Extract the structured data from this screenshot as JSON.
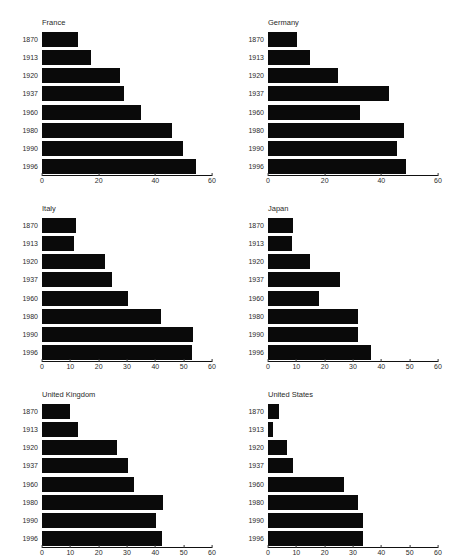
{
  "figure": {
    "caption_top": "",
    "bar_color": "#0a0a0a",
    "axis_color": "#111111",
    "text_color": "#2b2b2b"
  },
  "chart_data": [
    {
      "type": "bar",
      "title": "France",
      "orientation": "horizontal",
      "categories": [
        "1870",
        "1913",
        "1920",
        "1937",
        "1960",
        "1980",
        "1990",
        "1996"
      ],
      "values": [
        12.5,
        16.8,
        27.0,
        28.5,
        34.5,
        45.5,
        49.5,
        54.0
      ],
      "xlabel": "",
      "ylabel": "",
      "xlim": [
        0,
        60
      ],
      "xticks": [
        0,
        20,
        40,
        60
      ],
      "xticklabels": [
        "0",
        "20",
        "40",
        "60"
      ],
      "grid": false,
      "legend": null
    },
    {
      "type": "bar",
      "title": "Germany",
      "orientation": "horizontal",
      "categories": [
        "1870",
        "1913",
        "1920",
        "1937",
        "1960",
        "1980",
        "1990",
        "1996"
      ],
      "values": [
        10.0,
        14.5,
        24.5,
        42.5,
        32.0,
        47.5,
        45.0,
        48.5
      ],
      "xlabel": "",
      "ylabel": "",
      "xlim": [
        0,
        60
      ],
      "xticks": [
        0,
        20,
        40,
        60
      ],
      "xticklabels": [
        "0",
        "20",
        "40",
        "60"
      ],
      "grid": false,
      "legend": null
    },
    {
      "type": "bar",
      "title": "Italy",
      "orientation": "horizontal",
      "categories": [
        "1870",
        "1913",
        "1920",
        "1937",
        "1960",
        "1980",
        "1990",
        "1996"
      ],
      "values": [
        11.5,
        11.0,
        22.0,
        24.5,
        30.0,
        41.5,
        53.0,
        52.5
      ],
      "xlabel": "",
      "ylabel": "",
      "xlim": [
        0,
        60
      ],
      "xticks": [
        0,
        10,
        20,
        30,
        40,
        50,
        60
      ],
      "xticklabels": [
        "0",
        "10",
        "20",
        "30",
        "40",
        "50",
        "60"
      ],
      "grid": false,
      "legend": null
    },
    {
      "type": "bar",
      "title": "Japan",
      "orientation": "horizontal",
      "categories": [
        "1870",
        "1913",
        "1920",
        "1937",
        "1960",
        "1980",
        "1990",
        "1996"
      ],
      "values": [
        8.5,
        8.0,
        14.5,
        25.0,
        17.5,
        31.5,
        31.5,
        36.0
      ],
      "xlabel": "",
      "ylabel": "",
      "xlim": [
        0,
        60
      ],
      "xticks": [
        0,
        10,
        20,
        30,
        40,
        50,
        60
      ],
      "xticklabels": [
        "0",
        "10",
        "20",
        "30",
        "40",
        "50",
        "60"
      ],
      "grid": false,
      "legend": null
    },
    {
      "type": "bar",
      "title": "United Kingdom",
      "orientation": "horizontal",
      "categories": [
        "1870",
        "1913",
        "1920",
        "1937",
        "1960",
        "1980",
        "1990",
        "1996"
      ],
      "values": [
        9.5,
        12.5,
        26.0,
        30.0,
        32.0,
        42.5,
        40.0,
        42.0
      ],
      "xlabel": "",
      "ylabel": "",
      "xlim": [
        0,
        60
      ],
      "xticks": [
        0,
        10,
        20,
        30,
        40,
        50,
        60
      ],
      "xticklabels": [
        "0",
        "10",
        "20",
        "30",
        "40",
        "50",
        "60"
      ],
      "grid": false,
      "legend": null
    },
    {
      "type": "bar",
      "title": "United States",
      "orientation": "horizontal",
      "categories": [
        "1870",
        "1913",
        "1920",
        "1937",
        "1960",
        "1980",
        "1990",
        "1996"
      ],
      "values": [
        3.5,
        1.5,
        6.5,
        8.5,
        26.5,
        31.5,
        33.0,
        33.0
      ],
      "xlabel": "",
      "ylabel": "",
      "xlim": [
        0,
        60
      ],
      "xticks": [
        0,
        10,
        20,
        30,
        40,
        50,
        60
      ],
      "xticklabels": [
        "0",
        "10",
        "20",
        "30",
        "40",
        "50",
        "60"
      ],
      "grid": false,
      "legend": null
    }
  ]
}
